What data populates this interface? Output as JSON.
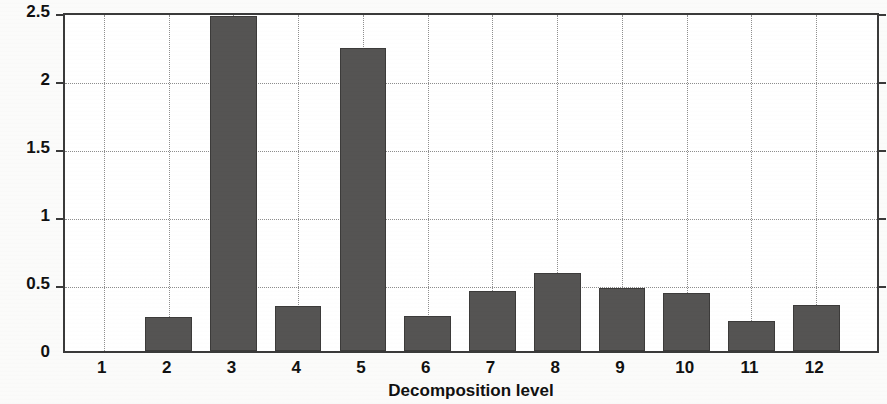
{
  "chart_data": {
    "type": "bar",
    "title": "",
    "xlabel": "Decomposition level",
    "ylabel": "Principal components",
    "categories": [
      "1",
      "2",
      "3",
      "4",
      "5",
      "6",
      "7",
      "8",
      "9",
      "10",
      "11",
      "12"
    ],
    "values": [
      0.0,
      0.25,
      2.46,
      0.33,
      2.23,
      0.26,
      0.44,
      0.57,
      0.46,
      0.43,
      0.22,
      0.34
    ],
    "series": [
      {
        "name": "Principal components",
        "values": [
          0.0,
          0.25,
          2.46,
          0.33,
          2.23,
          0.26,
          0.44,
          0.57,
          0.46,
          0.43,
          0.22,
          0.34
        ]
      }
    ],
    "yticks": [
      0,
      0.5,
      1,
      1.5,
      2,
      2.5
    ],
    "ytick_labels": [
      "0",
      "0.5",
      "1",
      "1.5",
      "2",
      "2.5"
    ],
    "ylim": [
      0,
      2.5
    ],
    "xlim": [
      0.4,
      13.0
    ],
    "grid": true,
    "grid_style": "dotted",
    "legend": null,
    "bar_color": "#555453",
    "bar_edge_color": "#3c3b3a",
    "axis_color": "#3a3a3a",
    "grid_color": "#8e8e8e",
    "background_color": "#ffffff"
  }
}
